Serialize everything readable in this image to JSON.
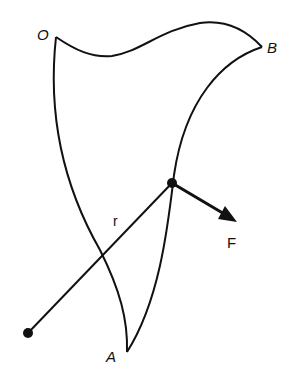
{
  "diagram": {
    "colors": {
      "stroke": "#111111",
      "background": "#ffffff"
    },
    "labels": {
      "O": "O",
      "B": "B",
      "A": "A",
      "r": "r",
      "F": "F"
    }
  }
}
